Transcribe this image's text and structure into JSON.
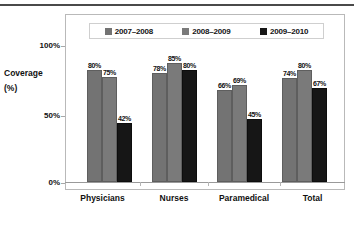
{
  "chart_data": {
    "type": "bar",
    "title": "",
    "subtitle": "",
    "xlabel": "",
    "ylabel": "Coverage (%)",
    "ylabel_lines": [
      "Coverage",
      "(%)"
    ],
    "categories": [
      "Physicians",
      "Nurses",
      "Paramedical",
      "Total"
    ],
    "series": [
      {
        "name": "2007–2008",
        "color": "#737373",
        "values": [
          80,
          78,
          66,
          74
        ],
        "labels": [
          "80%",
          "78%",
          "66%",
          "74%"
        ]
      },
      {
        "name": "2008–2009",
        "color": "#7a7a7a",
        "values": [
          75,
          85,
          69,
          80
        ],
        "labels": [
          "75%",
          "85%",
          "69%",
          "80%"
        ]
      },
      {
        "name": "2009–2010",
        "color": "#161616",
        "values": [
          42,
          80,
          45,
          67
        ],
        "labels": [
          "42%",
          "80%",
          "45%",
          "67%"
        ]
      }
    ],
    "ylim": [
      0,
      100
    ],
    "yticks": [
      0,
      50,
      100
    ],
    "ytick_labels": [
      "0%",
      "50%",
      "100%"
    ],
    "grid": false,
    "legend_position": "top-inside",
    "value_labels": true
  },
  "legend": {
    "entries": [
      {
        "label": "2007–2008",
        "swatch": "legend-swatch-2007-2008"
      },
      {
        "label": "2008–2009",
        "swatch": "legend-swatch-2008-2009"
      },
      {
        "label": "2009–2010",
        "swatch": "legend-swatch-2009-2010"
      }
    ]
  },
  "axis": {
    "y_title_line1": "Coverage",
    "y_title_line2": "(%)",
    "y_labels": [
      "100%",
      "50%",
      "0%"
    ],
    "x_labels": [
      "Physicians",
      "Nurses",
      "Paramedical",
      "Total"
    ]
  },
  "colors": {
    "series_2007_2008": "#737373",
    "series_2008_2009": "#7a7a7a",
    "series_2009_2010": "#161616",
    "frame": "#b9b9b9",
    "text": "#111111",
    "top_rule": "#4a4a4a"
  }
}
